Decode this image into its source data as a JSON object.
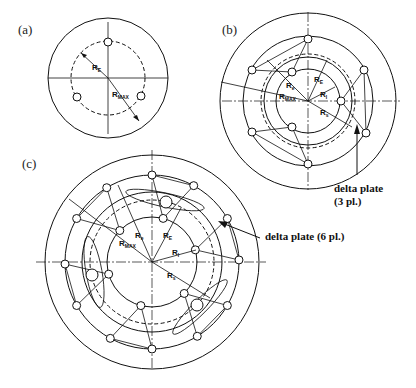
{
  "figure": {
    "panels": [
      {
        "id": "a",
        "label": "(a)",
        "radius_labels": [
          {
            "main": "R",
            "sub": "E"
          },
          {
            "main": "R",
            "sub": "MAX"
          }
        ],
        "bolt_holes": 3
      },
      {
        "id": "b",
        "label": "(b)",
        "radius_labels": [
          {
            "main": "R",
            "sub": "e"
          },
          {
            "main": "R",
            "sub": "E"
          },
          {
            "main": "R",
            "sub": "I"
          },
          {
            "main": "R",
            "sub": "MAX"
          },
          {
            "main": "R",
            "sub": "s"
          }
        ],
        "callout": {
          "line1": "delta plate",
          "line2": "(3 pl.)"
        }
      },
      {
        "id": "c",
        "label": "(c)",
        "radius_labels": [
          {
            "main": "R",
            "sub": "e"
          },
          {
            "main": "R",
            "sub": "E"
          },
          {
            "main": "R",
            "sub": "MAX"
          },
          {
            "main": "R",
            "sub": "I"
          },
          {
            "main": "R",
            "sub": "s"
          }
        ],
        "callout": {
          "line1": "delta plate (6 pl.)"
        }
      }
    ]
  }
}
